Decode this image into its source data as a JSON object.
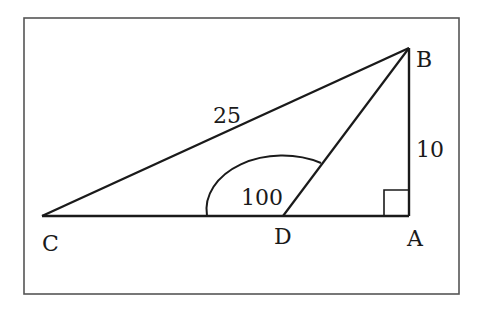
{
  "figure": {
    "type": "geometry-triangle",
    "frame": {
      "x": 24,
      "y": 18,
      "width": 435,
      "height": 276
    },
    "points": {
      "A": {
        "label": "A",
        "x": 409,
        "y": 216
      },
      "B": {
        "label": "B",
        "x": 409,
        "y": 48
      },
      "C": {
        "label": "C",
        "x": 42,
        "y": 216
      },
      "D": {
        "label": "D",
        "x": 283,
        "y": 216
      }
    },
    "segments": [
      {
        "from": "C",
        "to": "B",
        "label": "25"
      },
      {
        "from": "B",
        "to": "A",
        "label": "10"
      },
      {
        "from": "C",
        "to": "A",
        "label": ""
      },
      {
        "from": "B",
        "to": "D",
        "label": ""
      }
    ],
    "angle_marks": [
      {
        "vertex": "D",
        "label": "100",
        "between": [
          "C",
          "B"
        ]
      }
    ],
    "right_angle": {
      "vertex": "A"
    },
    "labels": {
      "side_cb": "25",
      "side_ab": "10",
      "angle_d": "100",
      "point_a": "A",
      "point_b": "B",
      "point_c": "C",
      "point_d": "D"
    },
    "colors": {
      "stroke": "#1a1a1a",
      "frame": "#555555",
      "background": "#ffffff"
    }
  }
}
